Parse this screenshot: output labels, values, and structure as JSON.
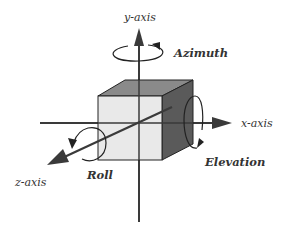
{
  "diagram": {
    "type": "3d-rotation-axes",
    "axes": {
      "x": {
        "label": "x-axis"
      },
      "y": {
        "label": "y-axis"
      },
      "z": {
        "label": "z-axis"
      }
    },
    "rotations": {
      "azimuth": {
        "label": "Azimuth",
        "about_axis": "y"
      },
      "elevation": {
        "label": "Elevation",
        "about_axis": "x"
      },
      "roll": {
        "label": "Roll",
        "about_axis": "z"
      }
    },
    "colors": {
      "axis": "#3a3a3a",
      "cube_front": "#e9e9e9",
      "cube_top": "#8a8a8a",
      "cube_right": "#5a5a5a",
      "outline": "#222222",
      "text": "#333333"
    }
  }
}
